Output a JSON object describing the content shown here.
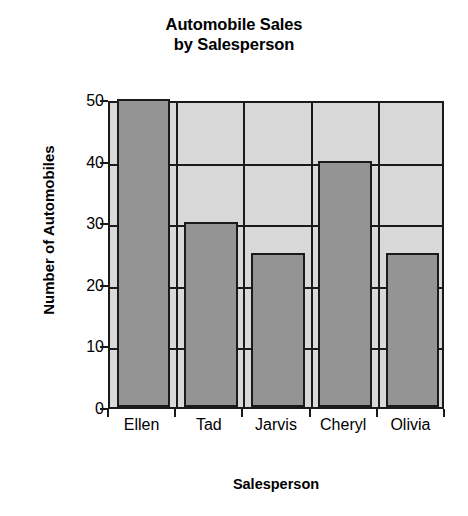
{
  "chart_data": {
    "type": "bar",
    "title": "Automobile Sales by Salesperson",
    "title_lines": [
      "Automobile Sales",
      "by Salesperson"
    ],
    "xlabel": "Salesperson",
    "ylabel": "Number of Automobiles",
    "categories": [
      "Ellen",
      "Tad",
      "Jarvis",
      "Cheryl",
      "Olivia"
    ],
    "values": [
      50,
      30,
      25,
      40,
      25
    ],
    "ylim": [
      0,
      50
    ],
    "ytick_labels": [
      "0",
      "10",
      "20",
      "30",
      "40",
      "50"
    ],
    "ytick_values": [
      0,
      10,
      20,
      30,
      40,
      50
    ],
    "grid": "horizontal-and-category-dividers",
    "legend": "none",
    "colors": {
      "bar_fill": "#949494",
      "bar_edge": "#1a1a1a",
      "plot_background": "#d9d9d9",
      "figure_background": "#ffffff",
      "text": "#000000",
      "gridline": "#1a1a1a"
    }
  }
}
